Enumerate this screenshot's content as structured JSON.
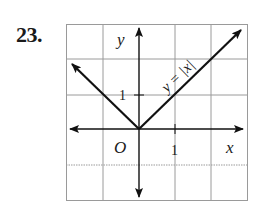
{
  "problem": {
    "number": "23."
  },
  "graph": {
    "equation_label": "y = |x|",
    "x_axis_label": "x",
    "y_axis_label": "y",
    "origin_label": "O",
    "x_tick_label": "1",
    "y_tick_label": "1",
    "grid": {
      "columns": 5,
      "rows": 5,
      "x_range": [
        -2,
        3
      ],
      "y_range": [
        -2,
        3
      ]
    },
    "colors": {
      "grid": "#9a9a9a",
      "ink": "#111111"
    }
  }
}
